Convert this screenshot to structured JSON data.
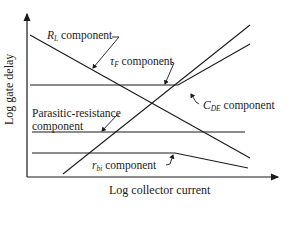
{
  "diagram": {
    "axes": {
      "y_label": "Log gate delay",
      "x_label": "Log collector current"
    },
    "curves": [
      {
        "id": "rl",
        "name_main": "R",
        "name_sub": "L",
        "suffix": " component"
      },
      {
        "id": "tauf",
        "name_main": "τ",
        "name_sub": "F",
        "suffix": " component"
      },
      {
        "id": "cde",
        "name_main": "C",
        "name_sub": "DE",
        "suffix": " component"
      },
      {
        "id": "parasitic",
        "line1": "Parasitic-resistance",
        "line2": "component"
      },
      {
        "id": "rbi",
        "name_main": "r",
        "name_sub": "bi",
        "suffix": " component"
      }
    ],
    "line_color": "#1a1a1a"
  }
}
